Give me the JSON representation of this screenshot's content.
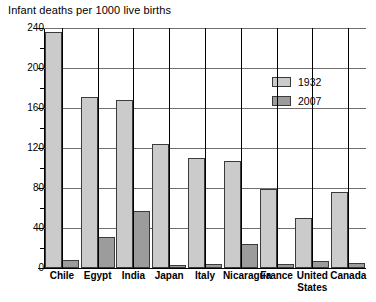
{
  "chart_data": {
    "type": "bar",
    "title": "Infant deaths per 1000 live births",
    "xlabel": "",
    "ylabel": "",
    "ylim": [
      0,
      240
    ],
    "ytick_step": 40,
    "yminor_step": 20,
    "grid": true,
    "legend_position": "top-right",
    "categories": [
      "Chile",
      "Egypt",
      "India",
      "Japan",
      "Italy",
      "Nicaragua",
      "France",
      "United States",
      "Canada"
    ],
    "series": [
      {
        "name": "1932",
        "color": "#cbcbcb",
        "values": [
          236,
          171,
          168,
          124,
          110,
          107,
          79,
          50,
          76
        ]
      },
      {
        "name": "2007",
        "color": "#9c9c9c",
        "values": [
          8,
          31,
          57,
          3,
          4,
          24,
          4,
          7,
          5
        ]
      }
    ],
    "yticks": [
      0,
      40,
      80,
      120,
      160,
      200,
      240
    ],
    "ytick_labels": [
      "0",
      "40",
      "80",
      "120",
      "160",
      "200",
      "240"
    ]
  },
  "legend": {
    "items": [
      {
        "label": "1932"
      },
      {
        "label": "2007"
      }
    ]
  }
}
